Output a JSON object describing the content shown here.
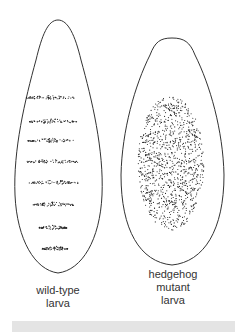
{
  "figure": {
    "larvae": [
      {
        "id": "wild-type",
        "label_lines": [
          "wild-type",
          "larva"
        ],
        "pattern": "segmented stripes",
        "stripe_count": 8
      },
      {
        "id": "hedgehog-mutant",
        "label_lines": [
          "hedgehog",
          "mutant",
          "larva"
        ],
        "pattern": "uniform lawn of denticles"
      }
    ],
    "colors": {
      "outline": "#333333",
      "dots": "#222222",
      "bottom_bar": "#e4e4e4"
    }
  }
}
